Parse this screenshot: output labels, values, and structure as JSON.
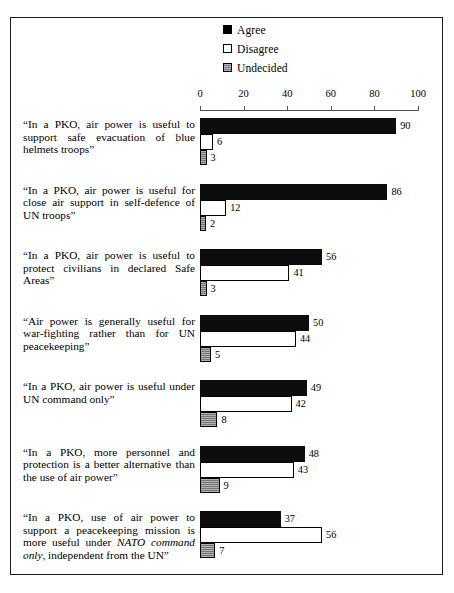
{
  "legend": {
    "position": "top-right",
    "items": [
      {
        "label": "Agree",
        "swatch": "legend-swatch-agree",
        "color": "#000000"
      },
      {
        "label": "Disagree",
        "swatch": "legend-swatch-disagree",
        "color": "#ffffff"
      },
      {
        "label": "Undecided",
        "swatch": "legend-swatch-undecided",
        "color": "#8a8a8a"
      }
    ]
  },
  "axis": {
    "ticks": [
      "0",
      "20",
      "40",
      "60",
      "80",
      "100"
    ],
    "min": 0,
    "max": 100
  },
  "chart_data": {
    "type": "bar",
    "orientation": "horizontal",
    "title": "",
    "subtitle": "",
    "xlabel": "",
    "ylabel": "",
    "xlim": [
      0,
      100
    ],
    "grid": false,
    "legend_position": "top-right",
    "categories": [
      "“In a PKO, air power is useful to support safe evacuation of blue helmets troops”",
      "“In a PKO, air power is useful for close air support in self-defence of UN troops”",
      "“In a PKO, air power is useful to protect civilians in declared Safe Areas”",
      "“Air power  is generally useful for war-fighting rather than for UN peacekeeping”",
      "“In a PKO, air power is useful under UN command only”",
      "“In a PKO, more personnel and protection is a better alternative than the use of air power”",
      "“In a PKO, use of air power to support a peacekeeping mission is more useful under NATO command only, independent from the UN”"
    ],
    "series": [
      {
        "name": "Agree",
        "values": [
          90,
          86,
          56,
          50,
          49,
          48,
          37
        ]
      },
      {
        "name": "Disagree",
        "values": [
          6,
          12,
          41,
          44,
          42,
          43,
          56
        ]
      },
      {
        "name": "Undecided",
        "values": [
          3,
          2,
          3,
          5,
          8,
          9,
          7
        ]
      }
    ]
  },
  "groups": [
    {
      "label_html": "“In a PKO, air power is useful to support safe evacuation of blue helmets troops”",
      "agree": 90,
      "disagree": 6,
      "undecided": 3,
      "agree_text": "90",
      "disagree_text": "6",
      "undecided_text": "3"
    },
    {
      "label_html": "“In a PKO, air power is useful for close air support in self-defence of UN troops”",
      "agree": 86,
      "disagree": 12,
      "undecided": 2,
      "agree_text": "86",
      "disagree_text": "12",
      "undecided_text": "2"
    },
    {
      "label_html": "“In a PKO, air power is useful to protect civilians in declared Safe Areas”",
      "agree": 56,
      "disagree": 41,
      "undecided": 3,
      "agree_text": "56",
      "disagree_text": "41",
      "undecided_text": "3"
    },
    {
      "label_html": "“Air power  is generally useful for war-fighting rather than for UN peacekeeping”",
      "agree": 50,
      "disagree": 44,
      "undecided": 5,
      "agree_text": "50",
      "disagree_text": "44",
      "undecided_text": "5"
    },
    {
      "label_html": "“In a PKO, air power is useful under UN command only”",
      "agree": 49,
      "disagree": 42,
      "undecided": 8,
      "agree_text": "49",
      "disagree_text": "42",
      "undecided_text": "8"
    },
    {
      "label_html": "“In a PKO, more personnel and protection is a better alternative than the use of air power”",
      "agree": 48,
      "disagree": 43,
      "undecided": 9,
      "agree_text": "48",
      "disagree_text": "43",
      "undecided_text": "9"
    },
    {
      "label_html": "“In a PKO, use of air power to support a peacekeeping mission is more useful under <i>NATO command only</i>, independent from the UN”",
      "agree": 37,
      "disagree": 56,
      "undecided": 7,
      "agree_text": "37",
      "disagree_text": "56",
      "undecided_text": "7"
    }
  ]
}
